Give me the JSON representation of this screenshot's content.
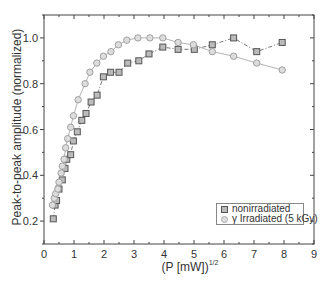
{
  "chart_data": {
    "type": "scatter",
    "title": "",
    "xlabel": "(P [mW])^1/2",
    "xlabel_base": "(P [mW])",
    "xlabel_sup": "1/2",
    "ylabel": "Peak-to-peak amplitude (normalized)",
    "xlim": [
      0,
      9
    ],
    "ylim": [
      0.1,
      1.1
    ],
    "xticks": [
      0,
      1,
      2,
      3,
      4,
      5,
      6,
      7,
      8,
      9
    ],
    "yticks": [
      0.2,
      0.4,
      0.6,
      0.8,
      1.0
    ],
    "ytick_labels": [
      "0.2",
      "0.4",
      "0.6",
      "0.8",
      "1.0"
    ],
    "grid": false,
    "legend_position": "lower right",
    "series": [
      {
        "name": "nonirradiated",
        "marker": "square",
        "color": "#555555",
        "fill": "#bbbbbb",
        "line": "dash-dot",
        "x": [
          0.31,
          0.37,
          0.42,
          0.5,
          0.61,
          0.7,
          0.76,
          0.89,
          0.98,
          1.11,
          1.26,
          1.4,
          1.57,
          1.77,
          1.98,
          2.22,
          2.5,
          2.79,
          3.16,
          3.5,
          3.96,
          4.47,
          5.01,
          5.61,
          6.32,
          7.09,
          7.94
        ],
        "y": [
          0.21,
          0.27,
          0.29,
          0.34,
          0.38,
          0.43,
          0.47,
          0.49,
          0.55,
          0.59,
          0.64,
          0.67,
          0.72,
          0.75,
          0.83,
          0.85,
          0.85,
          0.89,
          0.9,
          0.93,
          0.96,
          0.95,
          0.95,
          0.97,
          1.0,
          0.94,
          0.98
        ]
      },
      {
        "name": "γ Irradiated (5 kGy)",
        "marker": "circle",
        "color": "#a0a0a0",
        "fill": "#dddddd",
        "line": "solid",
        "x": [
          0.28,
          0.34,
          0.39,
          0.46,
          0.5,
          0.57,
          0.61,
          0.67,
          0.72,
          0.79,
          0.89,
          0.98,
          1.14,
          1.37,
          1.53,
          1.76,
          1.98,
          2.23,
          2.48,
          2.76,
          3.13,
          3.53,
          3.96,
          4.47,
          4.98,
          5.61,
          6.32,
          7.09,
          7.94
        ],
        "y": [
          0.27,
          0.3,
          0.32,
          0.34,
          0.37,
          0.41,
          0.44,
          0.47,
          0.52,
          0.56,
          0.61,
          0.66,
          0.73,
          0.8,
          0.85,
          0.89,
          0.92,
          0.94,
          0.97,
          0.99,
          1.0,
          1.0,
          1.0,
          0.98,
          0.97,
          0.94,
          0.92,
          0.89,
          0.86
        ]
      }
    ]
  },
  "legend": {
    "items": [
      {
        "label": "nonirradiated"
      },
      {
        "label": "γ Irradiated (5 kGy)"
      }
    ]
  }
}
